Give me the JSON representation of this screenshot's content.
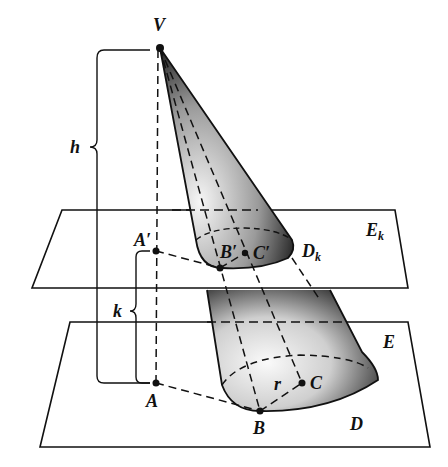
{
  "figure": {
    "colors": {
      "ink": "#111111",
      "paper": "#ffffff",
      "shade_dark": "#1a1a1a",
      "shade_light": "#f2f2f2"
    }
  },
  "labels": {
    "apex": "V",
    "height": "h",
    "offset": "k",
    "plane_upper": "E",
    "plane_upper_sub": "k",
    "plane_lower": "E",
    "a_prime": "A′",
    "b_prime": "B′",
    "c_prime": "C′",
    "d_k": "D",
    "d_k_sub": "k",
    "a": "A",
    "b": "B",
    "c": "C",
    "d": "D",
    "radius": "r"
  },
  "points": {
    "V": [
      160,
      48
    ],
    "A_prime": [
      156,
      251
    ],
    "B_prime": [
      220,
      268
    ],
    "C_prime": [
      245,
      253
    ],
    "A": [
      156,
      383
    ],
    "B": [
      260,
      411
    ],
    "C": [
      302,
      383
    ]
  }
}
